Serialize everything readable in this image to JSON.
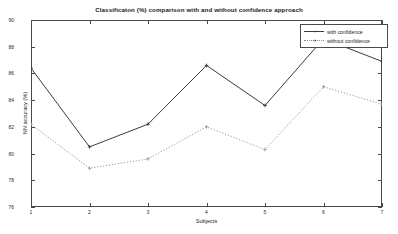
{
  "chart_data": {
    "type": "line",
    "title": "Classificaton (%) comparison with and without confidence approach",
    "xlabel": "Subjects",
    "ylabel": "NN accuracy (%)",
    "x": [
      1,
      2,
      3,
      4,
      5,
      6,
      7
    ],
    "xticklabels": [
      "1",
      "2",
      "3",
      "4",
      "5",
      "6",
      "7"
    ],
    "yticklabels": [
      "76",
      "78",
      "80",
      "82",
      "84",
      "86",
      "88",
      "90"
    ],
    "yticks": [
      76,
      78,
      80,
      82,
      84,
      86,
      88,
      90
    ],
    "xlim": [
      1,
      7
    ],
    "ylim": [
      76,
      90
    ],
    "grid": false,
    "legend_position": "top-right",
    "series": [
      {
        "name": "with confidence",
        "style": "solid",
        "marker": "plus",
        "color": "#3b3b3b",
        "values": [
          86.4,
          80.5,
          82.2,
          86.6,
          83.6,
          88.6,
          86.9
        ]
      },
      {
        "name": "without confidence",
        "style": "dotted",
        "marker": "plus",
        "color": "#9a9a9a",
        "values": [
          82.2,
          78.9,
          79.6,
          82.0,
          80.3,
          85.0,
          83.7
        ]
      }
    ]
  },
  "legend": {
    "items": [
      {
        "label": "with confidence"
      },
      {
        "label": "without confidence"
      }
    ]
  }
}
